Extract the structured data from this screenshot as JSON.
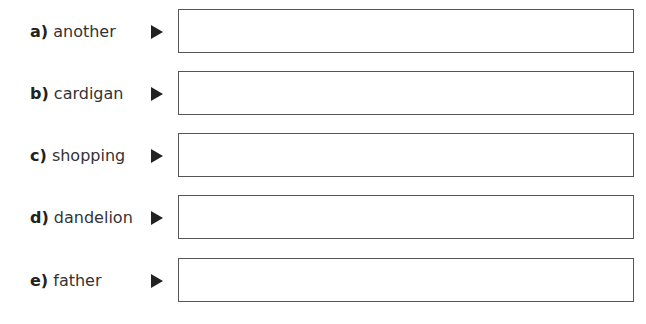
{
  "items": [
    {
      "letter": "a)",
      "word": "another",
      "answer": ""
    },
    {
      "letter": "b)",
      "word": "cardigan",
      "answer": ""
    },
    {
      "letter": "c)",
      "word": "shopping",
      "answer": ""
    },
    {
      "letter": "d)",
      "word": "dandelion",
      "answer": ""
    },
    {
      "letter": "e)",
      "word": "father",
      "answer": ""
    }
  ],
  "icons": {
    "arrow": "right-triangle-arrow"
  }
}
